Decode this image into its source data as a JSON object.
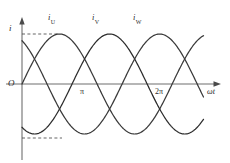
{
  "figure": {
    "axes": {
      "y_label": "i",
      "x_label": "ωt",
      "origin_label": "O"
    },
    "ticks": {
      "x": [
        {
          "label": "π",
          "value": 3.14159
        },
        {
          "label": "2π",
          "value": 6.28319
        }
      ]
    },
    "curve_labels": [
      {
        "base": "i",
        "sub": "U"
      },
      {
        "base": "i",
        "sub": "V"
      },
      {
        "base": "i",
        "sub": "W"
      }
    ],
    "colors": {
      "curve": "#3a3a3a",
      "axis": "#6f6f6f",
      "dash": "#4a4a4a",
      "background": "#ffffff"
    }
  },
  "chart_data": {
    "type": "line",
    "xlabel": "ωt",
    "ylabel": "i",
    "grid": false,
    "legend": "inline-labels-above-peaks",
    "xlim": [
      0,
      7.6
    ],
    "ylim": [
      -1.15,
      1.15
    ],
    "xticks": [
      3.14159,
      6.28319
    ],
    "xticklabels": [
      "π",
      "2π"
    ],
    "amplitude": 1,
    "annotations": [
      {
        "text": "+Im dashed level",
        "y": 1
      },
      {
        "text": "-Im dashed level",
        "y": -1
      }
    ],
    "series": [
      {
        "name": "i_U",
        "label": "i",
        "sublabel": "U",
        "phase_deg": 0,
        "formula": "sin(wt)",
        "color": "#3a3a3a",
        "x": [
          0,
          0.393,
          0.785,
          1.178,
          1.571,
          1.963,
          2.356,
          2.749,
          3.142,
          3.534,
          3.927,
          4.32,
          4.712,
          5.105,
          5.498,
          5.89,
          6.283,
          6.676,
          7.069,
          7.461
        ],
        "y": [
          0,
          0.383,
          0.707,
          0.924,
          1,
          0.924,
          0.707,
          0.383,
          0,
          -0.383,
          -0.707,
          -0.924,
          -1,
          -0.924,
          -0.707,
          -0.383,
          0,
          0.383,
          0.707,
          0.924
        ]
      },
      {
        "name": "i_V",
        "label": "i",
        "sublabel": "V",
        "phase_deg": -120,
        "formula": "sin(wt - 120°)",
        "color": "#3a3a3a",
        "x": [
          0,
          0.393,
          0.785,
          1.178,
          1.571,
          1.963,
          2.356,
          2.749,
          3.142,
          3.534,
          3.927,
          4.32,
          4.712,
          5.105,
          5.498,
          5.89,
          6.283,
          6.676,
          7.069,
          7.461
        ],
        "y": [
          -0.866,
          -0.985,
          -0.966,
          -0.809,
          -0.5,
          -0.131,
          0.259,
          0.609,
          0.866,
          0.991,
          0.966,
          0.793,
          0.5,
          0.131,
          -0.259,
          -0.609,
          -0.866,
          -0.991,
          -0.966,
          -0.793
        ]
      },
      {
        "name": "i_W",
        "label": "i",
        "sublabel": "W",
        "phase_deg": 120,
        "formula": "sin(wt + 120°)",
        "color": "#3a3a3a",
        "x": [
          0,
          0.393,
          0.785,
          1.178,
          1.571,
          1.963,
          2.356,
          2.749,
          3.142,
          3.534,
          3.927,
          4.32,
          4.712,
          5.105,
          5.498,
          5.89,
          6.283,
          6.676,
          7.069,
          7.461
        ],
        "y": [
          0.866,
          0.602,
          0.259,
          -0.131,
          -0.5,
          -0.793,
          -0.966,
          -0.991,
          -0.866,
          -0.602,
          -0.259,
          0.131,
          0.5,
          0.793,
          0.966,
          0.991,
          0.866,
          0.602,
          0.259,
          -0.131
        ]
      }
    ]
  }
}
